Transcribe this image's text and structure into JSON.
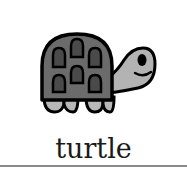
{
  "card": {
    "label": "turtle",
    "icon": "turtle-icon"
  },
  "colors": {
    "background": "#ffffff",
    "shell": "#6b6b6b",
    "scute": "#4a4a4a",
    "skin": "#b3b3b3",
    "outline": "#000000",
    "text": "#1a1a1a",
    "divider": "#8a8a8a"
  }
}
